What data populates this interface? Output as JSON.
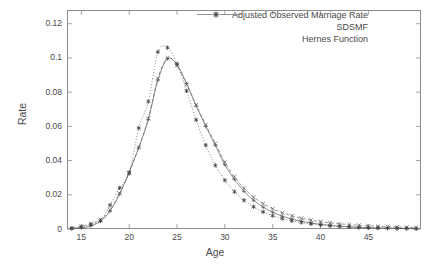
{
  "chart_data": {
    "type": "line",
    "title": "",
    "xlabel": "Age",
    "ylabel": "Rate",
    "xlim": [
      13.5,
      50.5
    ],
    "ylim": [
      0,
      0.128
    ],
    "xticks": [
      15,
      20,
      25,
      30,
      35,
      40,
      45
    ],
    "yticks": [
      0,
      0.02,
      0.04,
      0.06,
      0.08,
      0.1,
      0.12
    ],
    "ytick_labels": [
      "0",
      "0.02",
      "0.04",
      "0.06",
      "0.08",
      "0.1",
      "0.12"
    ],
    "xtick_labels": [
      "15",
      "20",
      "25",
      "30",
      "35",
      "40",
      "45"
    ],
    "grid": false,
    "legend_position": "top-right",
    "x": [
      14,
      15,
      16,
      17,
      18,
      19,
      20,
      21,
      22,
      23,
      24,
      25,
      26,
      27,
      28,
      29,
      30,
      31,
      32,
      33,
      34,
      35,
      36,
      37,
      38,
      39,
      40,
      41,
      42,
      43,
      44,
      45,
      46,
      47,
      48,
      49,
      50
    ],
    "series": [
      {
        "name": "Adjusted Observed Marriage Rate",
        "marker": "plus",
        "line": "solid",
        "color": "#555555",
        "values": [
          0.0002,
          0.0006,
          0.0018,
          0.0045,
          0.0105,
          0.0205,
          0.0335,
          0.0475,
          0.064,
          0.087,
          0.0995,
          0.096,
          0.085,
          0.072,
          0.06,
          0.049,
          0.0375,
          0.029,
          0.022,
          0.0168,
          0.0128,
          0.0098,
          0.0075,
          0.0058,
          0.0045,
          0.0035,
          0.0027,
          0.0021,
          0.0016,
          0.0013,
          0.001,
          0.0008,
          0.0006,
          0.0005,
          0.0004,
          0.0003,
          0.0002
        ]
      },
      {
        "name": "SDSMF",
        "marker": "cross",
        "line": "dashed",
        "color": "#666666",
        "values": [
          0.0005,
          0.0016,
          0.0032,
          0.0055,
          0.0112,
          0.0208,
          0.033,
          0.0478,
          0.0645,
          0.088,
          0.1,
          0.0955,
          0.0845,
          0.0725,
          0.061,
          0.05,
          0.039,
          0.0305,
          0.0238,
          0.0186,
          0.0148,
          0.0118,
          0.0095,
          0.0077,
          0.0063,
          0.0052,
          0.0043,
          0.0036,
          0.003,
          0.0026,
          0.0022,
          0.0019,
          0.0016,
          0.0014,
          0.0012,
          0.001,
          0.0009
        ]
      },
      {
        "name": "Hernes Function",
        "marker": "star",
        "line": "dotted",
        "color": "#444444",
        "values": [
          0.0004,
          0.0012,
          0.0026,
          0.0048,
          0.014,
          0.024,
          0.0325,
          0.059,
          0.0745,
          0.1035,
          0.106,
          0.0965,
          0.0808,
          0.0638,
          0.049,
          0.0372,
          0.0285,
          0.0218,
          0.0168,
          0.013,
          0.01,
          0.0078,
          0.0061,
          0.0048,
          0.0038,
          0.003,
          0.0024,
          0.0019,
          0.0015,
          0.0012,
          0.0009,
          0.0007,
          0.0006,
          0.0005,
          0.0004,
          0.0003,
          0.0002
        ]
      }
    ]
  },
  "axis": {
    "x_label": "Age",
    "y_label": "Rate"
  },
  "legend": {
    "entries": [
      {
        "label": "Adjusted Observed Marriage Rate"
      },
      {
        "label": "SDSMF"
      },
      {
        "label": "Hernes Function"
      }
    ]
  }
}
